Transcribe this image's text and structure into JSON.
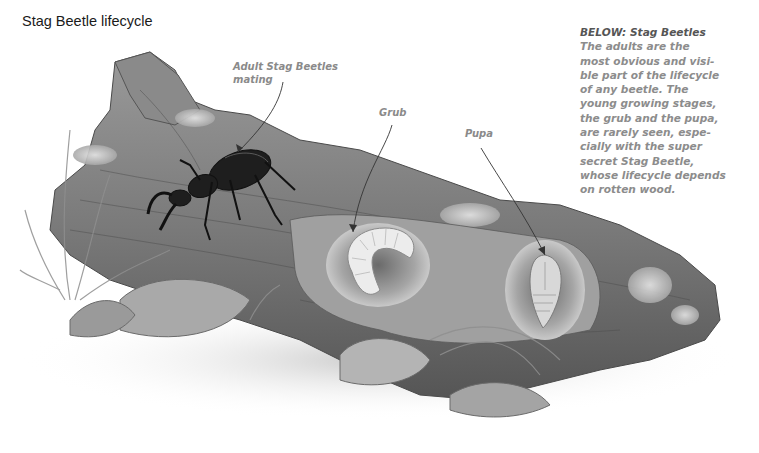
{
  "page": {
    "title": "Stag Beetle lifecycle"
  },
  "labels": {
    "adult": [
      "Adult Stag Beetles",
      "mating"
    ],
    "grub": "Grub",
    "pupa": "Pupa"
  },
  "caption": {
    "heading": "BELOW: Stag Beetles",
    "lines": [
      "The adults are the",
      "most obvious and visi-",
      "ble part of the lifecycle",
      "of any beetle. The",
      "young growing stages,",
      "the grub and the pupa,",
      "are rarely seen, espe-",
      "cially with the super",
      "secret Stag Beetle,",
      "whose lifecycle depends",
      "on rotten wood."
    ]
  },
  "illustration": {
    "subject": "Rotten log with stag beetle, grub and pupa",
    "colors": {
      "background": "#ffffff",
      "log_dark": "#5e5e5e",
      "log_mid": "#8d8d8d",
      "log_light": "#b9b9b9",
      "beetle": "#1e1e1e",
      "grub": "#e8e8e8",
      "annotation": "#8a8a8a"
    }
  }
}
